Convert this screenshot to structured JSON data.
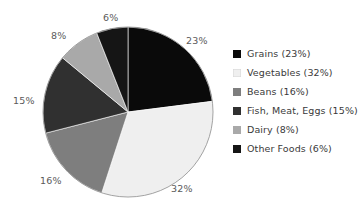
{
  "chart_data": {
    "type": "pie",
    "title": "",
    "subtitle": "",
    "xlabel": "",
    "ylabel": "",
    "legend_position": "right",
    "grid": false,
    "start_angle_deg": 0,
    "direction": "clockwise",
    "categories": [
      "Grains",
      "Vegetables",
      "Beans",
      "Fish, Meat, Eggs",
      "Dairy",
      "Other Foods"
    ],
    "values": [
      23,
      32,
      16,
      15,
      8,
      6
    ],
    "units": "percent",
    "data_labels": [
      "23%",
      "32%",
      "16%",
      "15%",
      "8%",
      "6%"
    ],
    "slice_colors": [
      "#0a0a0a",
      "#efefef",
      "#7e7e7e",
      "#303030",
      "#a9a9a9",
      "#151515"
    ],
    "slices": [
      {
        "name": "Grains",
        "value": 23,
        "label": "23%",
        "color": "#0a0a0a"
      },
      {
        "name": "Vegetables",
        "value": 32,
        "label": "32%",
        "color": "#efefef"
      },
      {
        "name": "Beans",
        "value": 16,
        "label": "16%",
        "color": "#7e7e7e"
      },
      {
        "name": "Fish, Meat, Eggs",
        "value": 15,
        "label": "15%",
        "color": "#303030"
      },
      {
        "name": "Dairy",
        "value": 8,
        "label": "8%",
        "color": "#a9a9a9"
      },
      {
        "name": "Other Foods",
        "value": 6,
        "label": "6%",
        "color": "#151515"
      }
    ],
    "legend": [
      {
        "label": "Grains (23%)",
        "color": "#0a0a0a"
      },
      {
        "label": "Vegetables (32%)",
        "color": "#efefef"
      },
      {
        "label": "Beans (16%)",
        "color": "#7e7e7e"
      },
      {
        "label": "Fish, Meat, Eggs (15%)",
        "color": "#303030"
      },
      {
        "label": "Dairy (8%)",
        "color": "#a9a9a9"
      },
      {
        "label": "Other Foods (6%)",
        "color": "#151515"
      }
    ]
  },
  "labels": {
    "grains_pct": "23%",
    "vegetables_pct": "32%",
    "beans_pct": "16%",
    "fish_meat_eggs_pct": "15%",
    "dairy_pct": "8%",
    "other_foods_pct": "6%"
  },
  "legend": {
    "items": [
      {
        "label": "Grains (23%)"
      },
      {
        "label": "Vegetables (32%)"
      },
      {
        "label": "Beans (16%)"
      },
      {
        "label": "Fish, Meat, Eggs (15%)"
      },
      {
        "label": "Dairy (8%)"
      },
      {
        "label": "Other Foods (6%)"
      }
    ]
  },
  "colors": {
    "background": "#ffffff",
    "label_text": "#5a5a5a",
    "legend_text": "#3a3a3a",
    "pie_outline": "#8a8a8a"
  }
}
